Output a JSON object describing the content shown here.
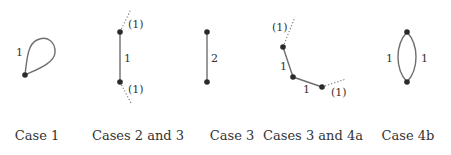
{
  "figure": {
    "panels": [
      {
        "id": "case1",
        "caption": "Case 1",
        "edge_labels": [
          "1"
        ],
        "vertices": 1,
        "description": "single vertex with a loop"
      },
      {
        "id": "cases23",
        "caption": "Cases 2 and 3",
        "edge_labels": [
          "1"
        ],
        "half_edge_labels": [
          "(1)",
          "(1)"
        ],
        "vertices": 2,
        "description": "two vertices joined by one edge, each with a dotted half-edge"
      },
      {
        "id": "case3",
        "caption": "Case 3",
        "edge_labels": [
          "2"
        ],
        "vertices": 2,
        "description": "two vertices joined by one edge of weight 2"
      },
      {
        "id": "cases34a",
        "caption": "Cases 3 and 4a",
        "edge_labels": [
          "1",
          "1"
        ],
        "half_edge_labels": [
          "(1)",
          "(1)"
        ],
        "vertices": 3,
        "description": "path of three vertices, end vertices each with a dotted half-edge"
      },
      {
        "id": "case4b",
        "caption": "Case 4b",
        "edge_labels": [
          "1",
          "1"
        ],
        "vertices": 2,
        "description": "two vertices joined by two parallel curved edges"
      }
    ]
  },
  "colors": {
    "edge": "#6e6e6e",
    "vertex": "#2b2b2b",
    "text": "#333333",
    "background": "#ffffff"
  }
}
